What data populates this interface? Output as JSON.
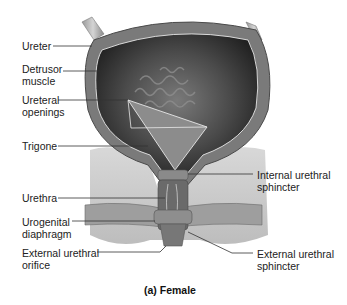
{
  "figure": {
    "caption": "(a) Female"
  },
  "labels_left": [
    {
      "id": "ureter",
      "text": "Ureter"
    },
    {
      "id": "detrusor",
      "text": "Detrusor\nmuscle"
    },
    {
      "id": "ureteral-openings",
      "text": "Ureteral\nopenings"
    },
    {
      "id": "trigone",
      "text": "Trigone"
    },
    {
      "id": "urethra",
      "text": "Urethra"
    },
    {
      "id": "urogenital-diaphragm",
      "text": "Urogenital\ndiaphragm"
    },
    {
      "id": "external-urethral-orifice",
      "text": "External urethral\norifice"
    }
  ],
  "labels_right": [
    {
      "id": "internal-urethral-sphincter",
      "text": "Internal urethral\nsphincter"
    },
    {
      "id": "external-urethral-sphincter",
      "text": "External urethral\nsphincter"
    }
  ],
  "colors": {
    "leader_line": "#333333",
    "bladder_wall": "#6e6e6e",
    "bladder_lumen": "#3a3a3a",
    "tissue": "#c8c8c8"
  }
}
